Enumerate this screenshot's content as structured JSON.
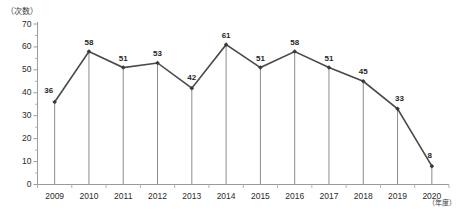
{
  "chart_data": {
    "type": "line",
    "title": "",
    "subtitle": "",
    "xlabel": "（年度）",
    "ylabel": "（次数）",
    "categories": [
      "2009",
      "2010",
      "2011",
      "2012",
      "2013",
      "2014",
      "2015",
      "2016",
      "2017",
      "2018",
      "2019",
      "2020"
    ],
    "values": [
      36,
      58,
      51,
      53,
      42,
      61,
      51,
      58,
      51,
      45,
      33,
      8
    ],
    "series": [
      {
        "name": "次数",
        "values": [
          36,
          58,
          51,
          53,
          42,
          61,
          51,
          58,
          51,
          45,
          33,
          8
        ]
      }
    ],
    "ylim": [
      0,
      70
    ],
    "ytick_labels": [
      "70",
      "60",
      "50",
      "40",
      "30",
      "20",
      "10",
      "0"
    ],
    "ytick_values": [
      70,
      60,
      50,
      40,
      30,
      20,
      10,
      0
    ],
    "grid": false,
    "legend": "none",
    "data_labels_shown": true,
    "markers": "diamond",
    "drop_lines": true,
    "line_color": "#4a4a4a",
    "marker_color": "#3a3a3a",
    "axis_color": "#9a9a9a",
    "text_color": "#2b2b2b"
  },
  "axis": {
    "y_unit_label": "（次数）",
    "x_unit_label": "（年度）"
  },
  "footnote": {
    "text": ""
  }
}
